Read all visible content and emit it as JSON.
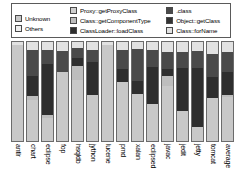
{
  "chart_data": {
    "type": "bar",
    "stacked": true,
    "normalized": true,
    "title": "",
    "subtitle": "",
    "xlabel": "",
    "ylabel": "",
    "ylim": [
      0,
      100
    ],
    "grid": false,
    "legend_position": "top",
    "categories": [
      "antlr",
      "chart",
      "eclipse",
      "fop",
      "hsqldb",
      "jython",
      "lucene",
      "pmd",
      "xalan",
      "eclipsed",
      "javac",
      "jedit",
      "jetty",
      "tomcat",
      "average"
    ],
    "series": [
      {
        "name": "Unknown",
        "color": "#c8c8c8",
        "values": [
          97,
          41,
          23,
          70,
          62,
          46,
          97,
          60,
          47,
          37,
          56,
          30,
          14,
          43,
          44
        ]
      },
      {
        "name": "Others",
        "color": "#efefef",
        "values": [
          0,
          0,
          0,
          0,
          0,
          0,
          0,
          0,
          0,
          0,
          0,
          0,
          0,
          0,
          0
        ]
      },
      {
        "name": "Proxy::getProxyClass",
        "color": "#cfcfcf",
        "values": [
          0,
          0,
          0,
          0,
          0,
          0,
          0,
          0,
          0,
          0,
          0,
          0,
          0,
          0,
          0
        ]
      },
      {
        "name": "Class::getComponentType",
        "color": "#bdbdbd",
        "values": [
          0,
          4,
          3,
          0,
          14,
          0,
          0,
          0,
          0,
          0,
          10,
          0,
          0,
          0,
          2
        ]
      },
      {
        "name": "ClassLoader::loadClass",
        "color": "#2e2e2e",
        "values": [
          0,
          21,
          52,
          0,
          8,
          34,
          0,
          13,
          14,
          38,
          7,
          44,
          60,
          22,
          24
        ]
      },
      {
        "name": ".class",
        "color": "#4a4a4a",
        "values": [
          0,
          26,
          14,
          21,
          10,
          12,
          0,
          19,
          32,
          17,
          17,
          16,
          17,
          23,
          20
        ]
      },
      {
        "name": "Object::getClass",
        "color": "#333333",
        "values": [
          0,
          0,
          0,
          0,
          0,
          0,
          0,
          0,
          0,
          0,
          0,
          0,
          0,
          0,
          0
        ]
      },
      {
        "name": "Class::forName",
        "color": "#e2e2e2",
        "values": [
          3,
          8,
          8,
          9,
          6,
          8,
          3,
          8,
          7,
          8,
          10,
          10,
          9,
          12,
          10
        ]
      }
    ]
  },
  "legend": {
    "columns": [
      {
        "entries": [
          {
            "label": "Unknown",
            "color": "#c8c8c8",
            "icon": "legend-swatch-unknown"
          },
          {
            "label": "Others",
            "color": "#efefef",
            "icon": "legend-swatch-others"
          }
        ]
      },
      {
        "entries": [
          {
            "label": "Proxy::getProxyClass",
            "color": "#cfcfcf",
            "icon": "legend-swatch-proxy-getproxyclass"
          },
          {
            "label": "Class::getComponentType",
            "color": "#bdbdbd",
            "icon": "legend-swatch-class-getcomponenttype"
          },
          {
            "label": "ClassLoader::loadClass",
            "color": "#2e2e2e",
            "icon": "legend-swatch-classloader-loadclass"
          }
        ]
      },
      {
        "entries": [
          {
            "label": ".class",
            "color": "#4a4a4a",
            "icon": "legend-swatch-dot-class"
          },
          {
            "label": "Object::getClass",
            "color": "#333333",
            "icon": "legend-swatch-object-getclass"
          },
          {
            "label": "Class::forName",
            "color": "#e2e2e2",
            "icon": "legend-swatch-class-forname"
          }
        ]
      }
    ]
  }
}
